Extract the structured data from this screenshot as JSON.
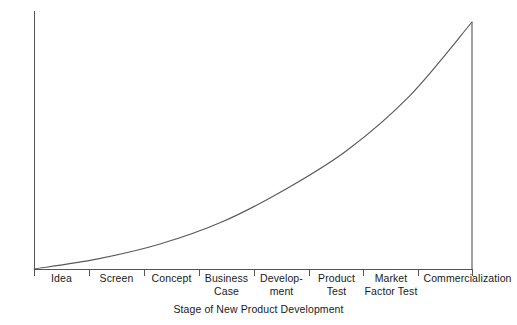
{
  "chart_data": {
    "type": "line",
    "title": "",
    "xlabel": "Stage of New Product Development",
    "ylabel": "Cost of Failure",
    "categories": [
      "Idea",
      "Screen",
      "Concept",
      "Business Case",
      "Development",
      "Product Test",
      "Market Factor Test",
      "Commercialization"
    ],
    "category_label_lines": [
      [
        "Idea"
      ],
      [
        "Screen"
      ],
      [
        "Concept"
      ],
      [
        "Business",
        "Case"
      ],
      [
        "Develop-",
        "ment"
      ],
      [
        "Product",
        "Test"
      ],
      [
        "Market",
        "Factor Test"
      ],
      [
        "Commercialization"
      ]
    ],
    "series": [
      {
        "name": "Cost of Failure",
        "values": [
          0,
          4,
          10,
          19,
          32,
          48,
          70,
          100
        ]
      }
    ],
    "x": [
      0,
      1,
      2,
      3,
      4,
      5,
      6,
      7
    ],
    "xlim": [
      0,
      7
    ],
    "ylim": [
      0,
      100
    ],
    "grid": false,
    "legend": false,
    "legend_position": "none",
    "x_tick_labels_shown": false,
    "y_tick_labels_shown": false,
    "annotations": [],
    "line_color": "#5a5a5a",
    "axis_color": "#555555",
    "background_color": "#ffffff"
  }
}
